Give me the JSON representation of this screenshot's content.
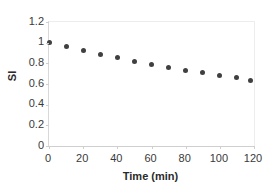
{
  "chart_data": {
    "type": "scatter",
    "title": "",
    "xlabel": "Time (min)",
    "ylabel": "SI",
    "xlim": [
      0,
      120
    ],
    "ylim": [
      0,
      1.2
    ],
    "grid": false,
    "legend": false,
    "marker": {
      "shape": "circle",
      "color": "#404040",
      "size_px": 5
    },
    "xticks": [
      0,
      20,
      40,
      60,
      80,
      100,
      120
    ],
    "xtick_labels": [
      "0",
      "20",
      "40",
      "60",
      "80",
      "100",
      "120"
    ],
    "yticks": [
      0,
      0.2,
      0.4,
      0.6,
      0.8,
      1,
      1.2
    ],
    "ytick_labels": [
      "0",
      "0.2",
      "0.4",
      "0.6",
      "0.8",
      "1",
      "1.2"
    ],
    "series": [
      {
        "name": "SI",
        "x": [
          0,
          10,
          20,
          30,
          40,
          50,
          60,
          70,
          80,
          90,
          100,
          110,
          118
        ],
        "values": [
          1.0,
          0.96,
          0.92,
          0.89,
          0.855,
          0.82,
          0.79,
          0.76,
          0.735,
          0.71,
          0.685,
          0.66,
          0.635
        ]
      }
    ]
  }
}
